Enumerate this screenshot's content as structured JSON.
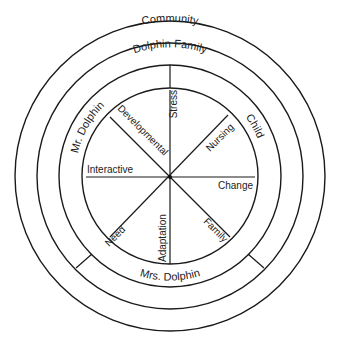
{
  "rings": {
    "community": "Community",
    "dolphin_family": "Dolphin Family",
    "mr_dolphin": "Mr. Dolphin",
    "child": "Child",
    "mrs_dolphin": "Mrs. Dolphin"
  },
  "spokes": {
    "stress": "Stress",
    "nursing": "Nursing",
    "change": "Change",
    "family": "Family",
    "adaptation": "Adaptation",
    "need": "Need",
    "interactive": "Interactive",
    "developmental": "Developmental"
  },
  "colors": {
    "stroke": "#1a1a1a",
    "background": "#ffffff"
  }
}
